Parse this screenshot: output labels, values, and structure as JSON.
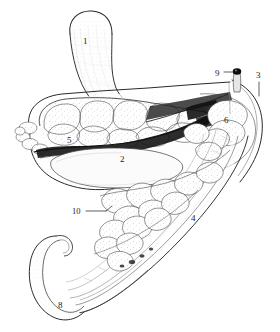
{
  "figure": {
    "style": "pen-and-ink stipple and hatch line art",
    "background_color": "#ffffff",
    "ink_color": "#1a1a1a",
    "width": 280,
    "height": 332
  },
  "labels": [
    {
      "id": "1",
      "text": "1",
      "x": 85,
      "y": 42,
      "leader": false
    },
    {
      "id": "2",
      "text": "2",
      "x": 122,
      "y": 160,
      "leader": false
    },
    {
      "id": "3",
      "text": "3",
      "x": 258,
      "y": 76,
      "leader": true
    },
    {
      "id": "4",
      "text": "4",
      "x": 193,
      "y": 219,
      "leader": false
    },
    {
      "id": "5",
      "text": "5",
      "x": 69,
      "y": 141,
      "leader": false
    },
    {
      "id": "6",
      "text": "6",
      "x": 226,
      "y": 121,
      "leader": false
    },
    {
      "id": "8",
      "text": "8",
      "x": 60,
      "y": 306,
      "leader": false
    },
    {
      "id": "9",
      "text": "9",
      "x": 218,
      "y": 74,
      "leader": true
    },
    {
      "id": "10",
      "text": "10",
      "x": 75,
      "y": 212,
      "leader": true
    }
  ],
  "regions": {
    "upper_projection": "1",
    "smooth_cavity": "2",
    "right_outer_wall": "3",
    "tapering_limb": "4",
    "left_lobulated_mass": "5",
    "right_lobule": "6",
    "hooked_terminal": "8",
    "duct_orifice_marker": "9",
    "lower_lobulated_band": "10"
  }
}
